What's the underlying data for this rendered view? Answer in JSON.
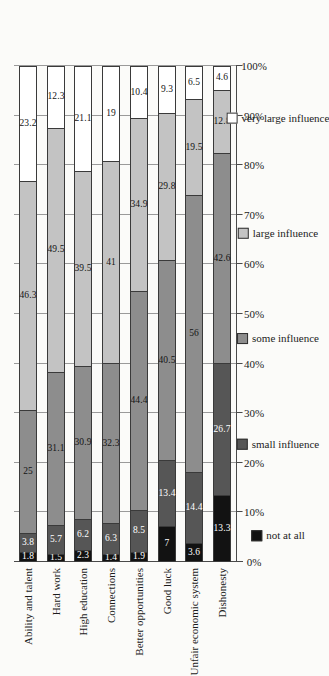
{
  "chart_data": {
    "type": "bar",
    "variant": "100% stacked horizontal bar",
    "title": "",
    "xlabel": "",
    "ylabel": "",
    "orientation": "bars rendered vertically (chart rotated 90 degrees)",
    "grid": true,
    "legend_position": "bottom",
    "xlim": [
      0,
      100
    ],
    "axis_ticks": [
      "0%",
      "10%",
      "20%",
      "30%",
      "40%",
      "50%",
      "60%",
      "70%",
      "80%",
      "90%",
      "100%"
    ],
    "tick_values": [
      0,
      10,
      20,
      30,
      40,
      50,
      60,
      70,
      80,
      90,
      100
    ],
    "categories": [
      "Ability and talent",
      "Hard work",
      "High education",
      "Connections",
      "Better opportunities",
      "Good luck",
      "Unfair economic system",
      "Dishonesty"
    ],
    "series": [
      {
        "name": "not at all",
        "color": "#121212",
        "values": [
          1.8,
          1.5,
          2.3,
          1.4,
          1.9,
          7,
          3.6,
          13.3
        ]
      },
      {
        "name": "small influence",
        "color": "#565656",
        "values": [
          3.8,
          5.7,
          6.2,
          6.3,
          8.5,
          13.4,
          14.4,
          26.7
        ]
      },
      {
        "name": "some influence",
        "color": "#8d8d8d",
        "values": [
          25,
          31.1,
          30.9,
          32.3,
          44.4,
          40.5,
          56,
          42.6
        ]
      },
      {
        "name": "large influence",
        "color": "#c3c3c3",
        "values": [
          46.3,
          49.5,
          39.5,
          41,
          34.9,
          29.8,
          19.5,
          12.8
        ]
      },
      {
        "name": "very large influence",
        "color": "#ffffff",
        "values": [
          23.2,
          12.3,
          21.1,
          19,
          10.4,
          9.3,
          6.5,
          4.6
        ]
      }
    ]
  },
  "legend": {
    "items": [
      {
        "label": "not at all",
        "color": "#121212"
      },
      {
        "label": "small influence",
        "color": "#565656"
      },
      {
        "label": "some influence",
        "color": "#8d8d8d"
      },
      {
        "label": "large influence",
        "color": "#c3c3c3"
      },
      {
        "label": "very large influence",
        "color": "#ffffff"
      }
    ]
  }
}
